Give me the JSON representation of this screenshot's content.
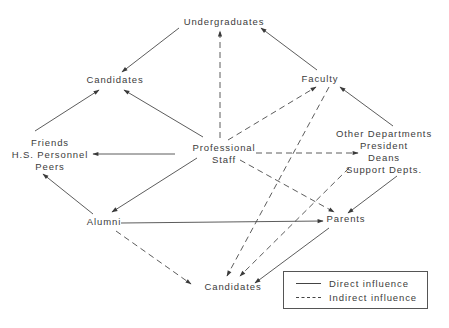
{
  "diagram": {
    "type": "influence-network",
    "nodes": {
      "undergraduates": {
        "label": "Undergraduates",
        "x": 224,
        "y": 16
      },
      "candidates_top": {
        "label": "Candidates",
        "x": 115,
        "y": 74
      },
      "faculty": {
        "label": "Faculty",
        "x": 320,
        "y": 73
      },
      "professional_staff": {
        "lines": [
          "Professional",
          "Staff"
        ],
        "x": 224,
        "y": 142
      },
      "friends_group": {
        "lines": [
          "Friends",
          "H.S. Personnel",
          "Peers"
        ],
        "x": 50,
        "y": 137
      },
      "other_group": {
        "lines": [
          "Other Departments",
          "President",
          "Deans",
          "Support Depts."
        ],
        "x": 384,
        "y": 128
      },
      "alumni": {
        "label": "Alumni",
        "x": 110,
        "y": 216
      },
      "parents": {
        "label": "Parents",
        "x": 346,
        "y": 213
      },
      "candidates_bottom": {
        "label": "Candidates",
        "x": 235,
        "y": 281
      }
    },
    "edges": [
      {
        "from": "undergraduates",
        "to": "candidates_top",
        "style": "direct"
      },
      {
        "from": "faculty",
        "to": "undergraduates",
        "style": "direct"
      },
      {
        "from": "professional_staff",
        "to": "undergraduates",
        "style": "indirect"
      },
      {
        "from": "professional_staff",
        "to": "candidates_top",
        "style": "direct"
      },
      {
        "from": "friends_group",
        "to": "candidates_top",
        "style": "direct"
      },
      {
        "from": "professional_staff",
        "to": "friends_group",
        "style": "direct"
      },
      {
        "from": "professional_staff",
        "to": "faculty",
        "style": "indirect"
      },
      {
        "from": "other_group",
        "to": "faculty",
        "style": "direct"
      },
      {
        "from": "professional_staff",
        "to": "other_group",
        "style": "indirect"
      },
      {
        "from": "professional_staff",
        "to": "alumni",
        "style": "direct"
      },
      {
        "from": "professional_staff",
        "to": "parents",
        "style": "indirect"
      },
      {
        "from": "alumni",
        "to": "friends_group",
        "style": "direct"
      },
      {
        "from": "alumni",
        "to": "parents",
        "style": "direct"
      },
      {
        "from": "alumni",
        "to": "candidates_bottom",
        "style": "indirect"
      },
      {
        "from": "faculty",
        "to": "candidates_bottom",
        "style": "indirect"
      },
      {
        "from": "other_group",
        "to": "candidates_bottom",
        "style": "indirect"
      },
      {
        "from": "other_group",
        "to": "parents",
        "style": "direct"
      },
      {
        "from": "parents",
        "to": "candidates_bottom",
        "style": "direct"
      }
    ],
    "legend": {
      "direct_label": "Direct influence",
      "indirect_label": "Indirect influence"
    },
    "colors": {
      "line": "#4a4a4a",
      "text": "#3c3c3c",
      "background": "#ffffff"
    }
  }
}
